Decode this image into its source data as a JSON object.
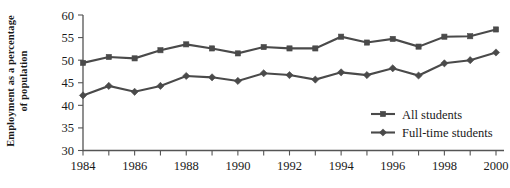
{
  "chart_data": {
    "type": "line",
    "title": "",
    "xlabel": "",
    "ylabel_line1": "Employment as a percentage",
    "ylabel_line2": "of population",
    "x": [
      1984,
      1985,
      1986,
      1987,
      1988,
      1989,
      1990,
      1991,
      1992,
      1993,
      1994,
      1995,
      1996,
      1997,
      1998,
      1999,
      2000
    ],
    "xtick_labels": [
      "1984",
      "1986",
      "1988",
      "1990",
      "1992",
      "1994",
      "1996",
      "1998",
      "2000"
    ],
    "xtick_values": [
      1984,
      1986,
      1988,
      1990,
      1992,
      1994,
      1996,
      1998,
      2000
    ],
    "xlim": [
      1984,
      2000
    ],
    "ytick_labels": [
      "30",
      "35",
      "40",
      "45",
      "50",
      "55",
      "60"
    ],
    "ytick_values": [
      30,
      35,
      40,
      45,
      50,
      55,
      60
    ],
    "ylim": [
      30,
      60
    ],
    "grid": false,
    "legend_position": "inside-lower-right",
    "series": [
      {
        "name": "All students",
        "marker": "square",
        "color": "#4a4a4a",
        "values": [
          49.4,
          50.7,
          50.4,
          52.2,
          53.5,
          52.6,
          51.5,
          52.9,
          52.6,
          52.6,
          55.2,
          53.9,
          54.7,
          53.0,
          55.2,
          55.3,
          56.8
        ]
      },
      {
        "name": "Full-time students",
        "marker": "diamond",
        "color": "#4a4a4a",
        "values": [
          42.2,
          44.3,
          43.0,
          44.3,
          46.5,
          46.2,
          45.4,
          47.1,
          46.7,
          45.7,
          47.3,
          46.7,
          48.2,
          46.6,
          49.3,
          50.0,
          51.7
        ]
      }
    ]
  },
  "legend": {
    "items": [
      {
        "label": "All students"
      },
      {
        "label": "Full-time students"
      }
    ]
  }
}
